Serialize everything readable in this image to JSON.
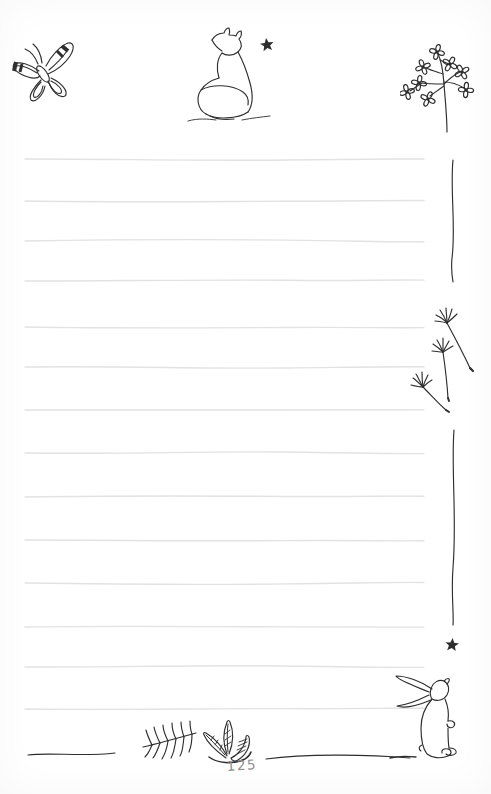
{
  "page": {
    "number": "125",
    "kind": "ruled notebook page"
  },
  "colors": {
    "background": "#ffffff",
    "ink": "#2e2e2e",
    "rule": "#e2e2e2",
    "page_number": "#8f8f8f"
  },
  "ruling": {
    "count": 14,
    "x_start": 25,
    "x_end": 424,
    "ys": [
      159,
      201,
      241,
      281,
      327,
      367,
      410,
      453,
      497,
      540,
      583,
      627,
      667,
      709
    ]
  },
  "illustrations": {
    "top_left": "butterfly",
    "top_center": "sitting fox gazing at a star",
    "top_right": "flowering branch",
    "right_upper": "curved stem line",
    "right_middle": "three drifting dandelion seeds",
    "right_lower": "curved stem line",
    "above_rabbit": "star",
    "bottom_right": "rabbit standing on hind legs",
    "bottom_center": "fern sprig and three leaves",
    "bottom_left": "hand-drawn ground line"
  }
}
